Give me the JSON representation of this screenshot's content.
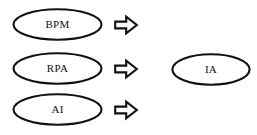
{
  "diagram": {
    "background_color": "#ffffff",
    "stroke_color": "#111111",
    "fill_color": "#ffffff",
    "inputs": [
      {
        "id": "bpm",
        "label": "BPM",
        "arrow_icon": "right-arrow-icon"
      },
      {
        "id": "rpa",
        "label": "RPA",
        "arrow_icon": "right-arrow-icon"
      },
      {
        "id": "ai",
        "label": "AI",
        "arrow_icon": "right-arrow-icon"
      }
    ],
    "output": {
      "id": "ia",
      "label": "IA"
    }
  }
}
